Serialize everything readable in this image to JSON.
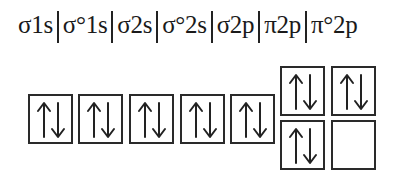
{
  "orbital_labels": [
    "σ1s",
    "σ°1s",
    "σ2s",
    "σ°2s",
    "σ2p",
    "π2p",
    "π°2p"
  ],
  "boxes": [
    {
      "orbital": "σ1s",
      "electrons": "↑↓",
      "up": true,
      "down": true
    },
    {
      "orbital": "σ°1s",
      "electrons": "↑↓",
      "up": true,
      "down": true
    },
    {
      "orbital": "σ2s",
      "electrons": "↑↓",
      "up": true,
      "down": true
    },
    {
      "orbital": "σ°2s",
      "electrons": "↑↓",
      "up": true,
      "down": true
    },
    {
      "orbital": "σ2p",
      "electrons": "↑↓",
      "up": true,
      "down": true
    },
    {
      "orbital": "π2p (top)",
      "electrons": "↑↓",
      "up": true,
      "down": true
    },
    {
      "orbital": "π°2p (top)",
      "electrons": "↑↓",
      "up": true,
      "down": true
    },
    {
      "orbital": "π2p (bottom)",
      "electrons": "↑↓",
      "up": true,
      "down": true
    },
    {
      "orbital": "π°2p (bottom)",
      "electrons": "",
      "up": false,
      "down": false
    }
  ]
}
